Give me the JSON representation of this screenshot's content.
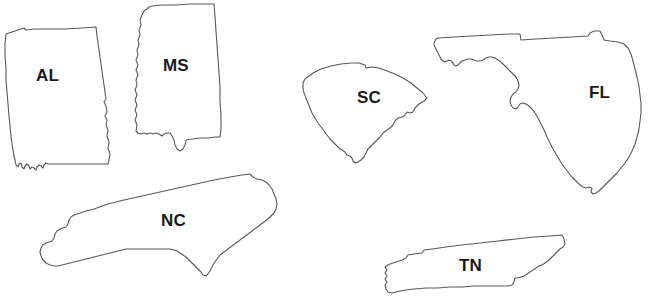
{
  "canvas": {
    "width": 662,
    "height": 303,
    "background_color": "#ffffff",
    "outline_color": "#595959",
    "label_color": "#1a1a1a"
  },
  "map": {
    "kind": "state-outline-collection",
    "states": [
      {
        "abbr": "AL",
        "name": "Alabama",
        "label_x": 36,
        "label_y": 67,
        "box": {
          "x": 4,
          "y": 26,
          "w": 108,
          "h": 146
        }
      },
      {
        "abbr": "MS",
        "name": "Mississippi",
        "label_x": 163,
        "label_y": 57,
        "box": {
          "x": 128,
          "y": 3,
          "w": 94,
          "h": 150
        }
      },
      {
        "abbr": "SC",
        "name": "South Carolina",
        "label_x": 357,
        "label_y": 89,
        "box": {
          "x": 297,
          "y": 60,
          "w": 132,
          "h": 108
        }
      },
      {
        "abbr": "FL",
        "name": "Florida",
        "label_x": 589,
        "label_y": 84,
        "box": {
          "x": 432,
          "y": 30,
          "w": 226,
          "h": 168
        }
      },
      {
        "abbr": "NC",
        "name": "North Carolina",
        "label_x": 161,
        "label_y": 212,
        "box": {
          "x": 36,
          "y": 168,
          "w": 250,
          "h": 118
        }
      },
      {
        "abbr": "TN",
        "name": "Tennessee",
        "label_x": 459,
        "label_y": 257,
        "box": {
          "x": 366,
          "y": 234,
          "w": 262,
          "h": 62
        }
      }
    ]
  }
}
